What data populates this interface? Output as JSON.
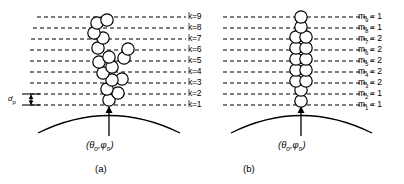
{
  "figure": {
    "type": "scientific-diagram",
    "stroke_color": "#000000",
    "background_color": "#ffffff",
    "dash_pattern": "4 3"
  },
  "levels": {
    "label_prefix": "k=",
    "items": [
      {
        "k": 9,
        "label": "k=9",
        "y": 17
      },
      {
        "k": 8,
        "label": "k=8",
        "y": 28
      },
      {
        "k": 7,
        "label": "k=7",
        "y": 39
      },
      {
        "k": 6,
        "label": "k=6",
        "y": 50
      },
      {
        "k": 5,
        "label": "k=5",
        "y": 61
      },
      {
        "k": 4,
        "label": "k=4",
        "y": 72
      },
      {
        "k": 3,
        "label": "k=3",
        "y": 83
      },
      {
        "k": 2,
        "label": "k=2",
        "y": 94
      },
      {
        "k": 1,
        "label": "k=1",
        "y": 105
      }
    ]
  },
  "occupancy": {
    "symbol": "m",
    "items": [
      {
        "sub": "9",
        "value": "1",
        "text": "m9 = 1"
      },
      {
        "sub": "8",
        "value": "1",
        "text": "m8 = 1"
      },
      {
        "sub": "7",
        "value": "2",
        "text": "m7 = 2"
      },
      {
        "sub": "6",
        "value": "2",
        "text": "m6 = 2"
      },
      {
        "sub": "5",
        "value": "2",
        "text": "m5 = 2"
      },
      {
        "sub": "4",
        "value": "2",
        "text": "m4 = 2"
      },
      {
        "sub": "3",
        "value": "2",
        "text": "m3 = 2"
      },
      {
        "sub": "2",
        "value": "1",
        "text": "m2 = 1"
      },
      {
        "sub": "1",
        "value": "1",
        "text": "m1 = 1"
      }
    ]
  },
  "dp_marker": {
    "symbol": "d",
    "subscript": "p",
    "text": "dp",
    "meaning": "particle diameter / layer spacing"
  },
  "panel_a": {
    "caption": "(a)",
    "coord_label": "(θo,φo)",
    "theta": "θ",
    "phi": "φ",
    "coord_sub": "o",
    "particles": [
      {
        "cx": 109,
        "cy": 100,
        "r": 6.2
      },
      {
        "cx": 118,
        "cy": 93,
        "r": 6.2
      },
      {
        "cx": 107,
        "cy": 89,
        "r": 6.2
      },
      {
        "cx": 112,
        "cy": 80,
        "r": 6.2
      },
      {
        "cx": 122,
        "cy": 79,
        "r": 6.2
      },
      {
        "cx": 103,
        "cy": 73,
        "r": 6.2
      },
      {
        "cx": 112,
        "cy": 67,
        "r": 6.2
      },
      {
        "cx": 99,
        "cy": 62,
        "r": 6.2
      },
      {
        "cx": 109,
        "cy": 57,
        "r": 6.2
      },
      {
        "cx": 124,
        "cy": 58,
        "r": 6.2
      },
      {
        "cx": 128,
        "cy": 49,
        "r": 6.2
      },
      {
        "cx": 98,
        "cy": 48,
        "r": 6.2
      },
      {
        "cx": 103,
        "cy": 38,
        "r": 6.2
      },
      {
        "cx": 94,
        "cy": 33,
        "r": 6.2
      },
      {
        "cx": 97,
        "cy": 23,
        "r": 6.2
      },
      {
        "cx": 107,
        "cy": 20,
        "r": 6.2
      }
    ]
  },
  "panel_b": {
    "caption": "(b)",
    "coord_label": "(θo,φo)",
    "theta": "θ",
    "phi": "φ",
    "coord_sub": "o",
    "particles": [
      {
        "cx": 301,
        "cy": 101,
        "r": 6.2
      },
      {
        "cx": 301,
        "cy": 90,
        "r": 6.2
      },
      {
        "cx": 296,
        "cy": 81,
        "r": 6.2
      },
      {
        "cx": 306,
        "cy": 81,
        "r": 6.2
      },
      {
        "cx": 296,
        "cy": 70,
        "r": 6.2
      },
      {
        "cx": 306,
        "cy": 70,
        "r": 6.2
      },
      {
        "cx": 296,
        "cy": 59,
        "r": 6.2
      },
      {
        "cx": 306,
        "cy": 59,
        "r": 6.2
      },
      {
        "cx": 296,
        "cy": 48,
        "r": 6.2
      },
      {
        "cx": 306,
        "cy": 48,
        "r": 6.2
      },
      {
        "cx": 296,
        "cy": 37,
        "r": 6.2
      },
      {
        "cx": 306,
        "cy": 37,
        "r": 6.2
      },
      {
        "cx": 301,
        "cy": 27,
        "r": 6.2
      },
      {
        "cx": 301,
        "cy": 17,
        "r": 6.2
      }
    ]
  }
}
